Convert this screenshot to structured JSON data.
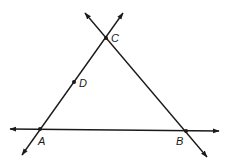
{
  "diagram": {
    "type": "geometry",
    "points": [
      {
        "name": "A",
        "label": "A",
        "x": 40,
        "y": 129,
        "label_x": 38,
        "label_y": 145
      },
      {
        "name": "B",
        "label": "B",
        "x": 186,
        "y": 131,
        "label_x": 176,
        "label_y": 145
      },
      {
        "name": "C",
        "label": "C",
        "x": 106,
        "y": 38,
        "label_x": 111,
        "label_y": 42
      },
      {
        "name": "D",
        "label": "D",
        "x": 74,
        "y": 82,
        "label_x": 79,
        "label_y": 87
      }
    ],
    "lines": [
      {
        "name": "line-AB",
        "through": [
          "A",
          "B"
        ],
        "x1": 10,
        "y1": 129,
        "x2": 219,
        "y2": 131,
        "arrows": "both"
      },
      {
        "name": "line-AC",
        "through": [
          "A",
          "D",
          "C"
        ],
        "x1": 22,
        "y1": 155,
        "x2": 123,
        "y2": 13,
        "arrows": "both"
      },
      {
        "name": "line-BC",
        "through": [
          "C",
          "B"
        ],
        "x1": 85,
        "y1": 13,
        "x2": 207,
        "y2": 157,
        "arrows": "both"
      }
    ],
    "stroke_color": "#1a1a1a"
  }
}
